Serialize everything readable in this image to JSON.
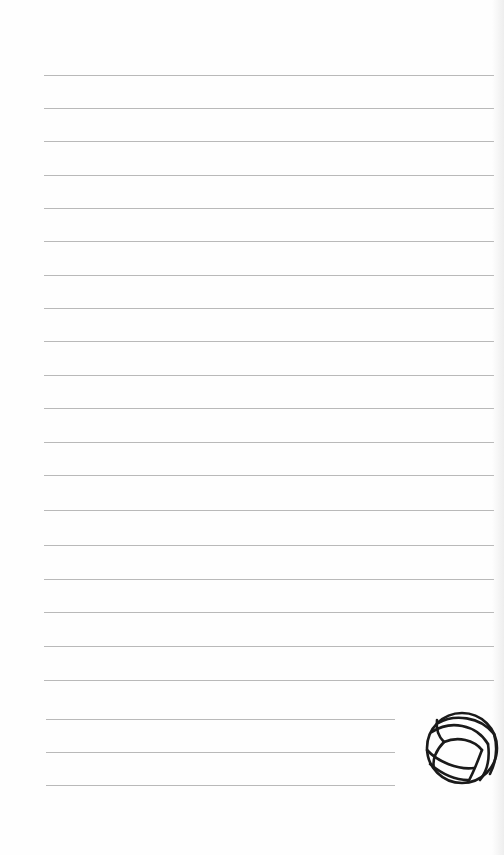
{
  "page": {
    "type": "lined notepaper",
    "background": "#fefefe",
    "line_color": "#b9b9b9"
  },
  "lines": {
    "full": {
      "x_start": 44,
      "x_end": 494,
      "y": [
        75,
        108,
        141,
        175,
        208,
        241,
        275,
        308,
        341,
        375,
        408,
        442,
        475,
        510,
        545,
        579,
        612,
        646,
        680
      ]
    },
    "short": {
      "x_start": 46,
      "x_end": 395,
      "y": [
        719,
        752,
        785
      ]
    }
  },
  "decoration": {
    "icon": "volleyball-icon",
    "stroke_color": "#1a1a1a"
  }
}
